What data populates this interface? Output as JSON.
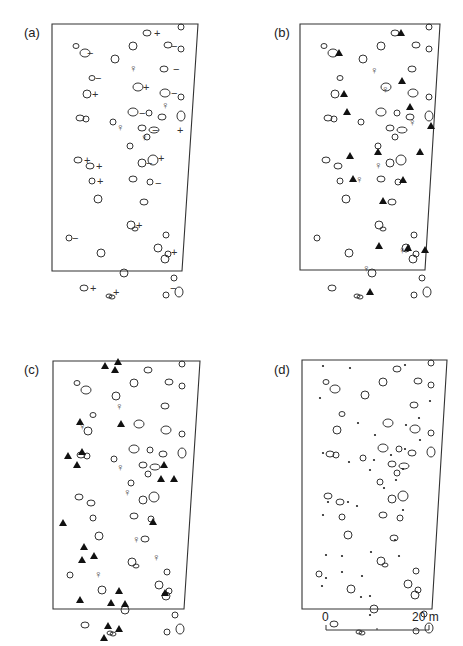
{
  "figure": {
    "panels": [
      {
        "id": "a",
        "label": "(a)",
        "symbols_present": [
          "stone",
          "plus",
          "minus",
          "female"
        ]
      },
      {
        "id": "b",
        "label": "(b)",
        "symbols_present": [
          "stone",
          "triangle",
          "female"
        ]
      },
      {
        "id": "c",
        "label": "(c)",
        "symbols_present": [
          "stone",
          "triangle",
          "female"
        ]
      },
      {
        "id": "d",
        "label": "(d)",
        "symbols_present": [
          "stone",
          "dot"
        ]
      }
    ],
    "scale_bar": {
      "start_label": "0",
      "end_label": "20 m"
    }
  },
  "symbols": {
    "plus": "+",
    "minus": "−",
    "female": "♀"
  },
  "stones": [
    [
      95,
      9,
      4,
      3
    ],
    [
      129,
      3,
      3,
      3
    ],
    [
      24,
      22,
      3,
      2.5
    ],
    [
      33,
      29,
      5,
      4
    ],
    [
      81,
      22,
      4,
      4
    ],
    [
      116,
      21,
      4,
      3
    ],
    [
      129,
      25,
      3,
      3
    ],
    [
      63,
      35,
      4,
      4
    ],
    [
      112,
      45,
      4,
      3
    ],
    [
      40,
      54,
      3,
      2.5
    ],
    [
      35,
      70,
      4,
      4
    ],
    [
      86,
      63,
      5,
      4
    ],
    [
      113,
      69,
      5,
      4
    ],
    [
      129,
      73,
      3,
      3
    ],
    [
      97,
      89,
      3,
      3
    ],
    [
      110,
      93,
      4,
      3
    ],
    [
      28,
      94,
      4,
      3
    ],
    [
      34,
      95,
      3,
      3
    ],
    [
      81,
      88,
      5,
      4
    ],
    [
      129,
      92,
      4,
      5
    ],
    [
      61,
      98,
      3,
      3
    ],
    [
      90,
      104,
      4,
      3
    ],
    [
      102,
      106,
      5,
      3
    ],
    [
      95,
      113,
      3,
      3
    ],
    [
      78,
      122,
      3,
      3
    ],
    [
      26,
      136,
      4,
      3
    ],
    [
      38,
      142,
      4,
      3
    ],
    [
      90,
      139,
      4,
      4
    ],
    [
      101,
      136,
      5,
      5
    ],
    [
      40,
      157,
      3,
      3
    ],
    [
      81,
      155,
      4,
      3
    ],
    [
      98,
      158,
      3,
      3
    ],
    [
      46,
      175,
      4,
      4
    ],
    [
      92,
      178,
      4,
      3
    ],
    [
      17,
      214,
      3,
      3
    ],
    [
      79,
      201,
      4,
      4
    ],
    [
      83,
      205,
      3,
      2
    ],
    [
      114,
      211,
      3,
      3
    ],
    [
      49,
      229,
      4,
      4
    ],
    [
      106,
      224,
      4,
      4
    ],
    [
      116,
      230,
      3,
      3
    ],
    [
      72,
      249,
      4,
      4
    ],
    [
      113,
      235,
      4,
      4
    ],
    [
      122,
      254,
      3,
      3
    ],
    [
      32,
      264,
      4,
      3
    ],
    [
      57,
      272,
      3,
      2
    ],
    [
      60,
      273,
      3,
      2
    ],
    [
      114,
      271,
      3,
      3
    ],
    [
      127,
      268,
      4,
      5
    ]
  ],
  "panel_a_marks": [
    [
      "plus",
      [
        105,
        9
      ]
    ],
    [
      "minus",
      [
        38,
        29
      ]
    ],
    [
      "minus",
      [
        122,
        22
      ]
    ],
    [
      "female",
      [
        80,
        44
      ]
    ],
    [
      "minus",
      [
        124,
        45
      ]
    ],
    [
      "minus",
      [
        46,
        54
      ]
    ],
    [
      "plus",
      [
        43,
        70
      ]
    ],
    [
      "plus",
      [
        94,
        63
      ]
    ],
    [
      "minus",
      [
        122,
        69
      ]
    ],
    [
      "female",
      [
        112,
        81
      ]
    ],
    [
      "minus",
      [
        90,
        89
      ]
    ],
    [
      "female",
      [
        67,
        103
      ]
    ],
    [
      "minus",
      [
        103,
        106
      ]
    ],
    [
      "plus",
      [
        128,
        106
      ]
    ],
    [
      "plus",
      [
        35,
        136
      ]
    ],
    [
      "plus",
      [
        47,
        142
      ]
    ],
    [
      "minus",
      [
        97,
        139
      ]
    ],
    [
      "plus",
      [
        109,
        134
      ]
    ],
    [
      "female",
      [
        91,
        113
      ]
    ],
    [
      "plus",
      [
        48,
        157
      ]
    ],
    [
      "minus",
      [
        106,
        159
      ]
    ],
    [
      "minus",
      [
        23,
        214
      ]
    ],
    [
      "plus",
      [
        87,
        201
      ]
    ],
    [
      "plus",
      [
        122,
        228
      ]
    ],
    [
      "plus",
      [
        41,
        264
      ]
    ],
    [
      "plus",
      [
        64,
        268
      ]
    ],
    [
      "minus",
      [
        121,
        264
      ]
    ]
  ],
  "panel_b_marks": [
    [
      "tri",
      [
        101,
        9
      ]
    ],
    [
      "tri",
      [
        39,
        29
      ]
    ],
    [
      "female",
      [
        73,
        46
      ]
    ],
    [
      "tri",
      [
        102,
        57
      ]
    ],
    [
      "tri",
      [
        44,
        70
      ]
    ],
    [
      "female",
      [
        84,
        65
      ]
    ],
    [
      "tri",
      [
        47,
        88
      ]
    ],
    [
      "tri",
      [
        110,
        83
      ]
    ],
    [
      "female",
      [
        111,
        98
      ]
    ],
    [
      "tri",
      [
        131,
        102
      ]
    ],
    [
      "tri",
      [
        50,
        132
      ]
    ],
    [
      "tri",
      [
        78,
        128
      ]
    ],
    [
      "tri",
      [
        120,
        128
      ]
    ],
    [
      "female",
      [
        77,
        141
      ]
    ],
    [
      "female",
      [
        58,
        155
      ]
    ],
    [
      "tri",
      [
        53,
        155
      ]
    ],
    [
      "tri",
      [
        103,
        156
      ]
    ],
    [
      "tri",
      [
        83,
        177
      ]
    ],
    [
      "tri",
      [
        79,
        222
      ]
    ],
    [
      "tri",
      [
        108,
        224
      ]
    ],
    [
      "female",
      [
        101,
        226
      ]
    ],
    [
      "tri",
      [
        125,
        226
      ]
    ],
    [
      "female",
      [
        65,
        244
      ]
    ],
    [
      "tri",
      [
        70,
        268
      ]
    ]
  ],
  "panel_c_marks": [
    [
      "tri",
      [
        52,
        5
      ]
    ],
    [
      "tri",
      [
        65,
        1
      ]
    ],
    [
      "tri",
      [
        62,
        9
      ]
    ],
    [
      "female",
      [
        65,
        45
      ]
    ],
    [
      "tri",
      [
        27,
        61
      ]
    ],
    [
      "tri",
      [
        68,
        63
      ]
    ],
    [
      "female",
      [
        28,
        65
      ]
    ],
    [
      "tri",
      [
        15,
        95
      ]
    ],
    [
      "tri",
      [
        29,
        91
      ]
    ],
    [
      "tri",
      [
        24,
        104
      ]
    ],
    [
      "female",
      [
        66,
        106
      ]
    ],
    [
      "tri",
      [
        111,
        104
      ]
    ],
    [
      "tri",
      [
        108,
        118
      ]
    ],
    [
      "tri",
      [
        121,
        118
      ]
    ],
    [
      "tri",
      [
        10,
        162
      ]
    ],
    [
      "tri",
      [
        100,
        161
      ]
    ],
    [
      "female",
      [
        73,
        131
      ]
    ],
    [
      "female",
      [
        82,
        178
      ]
    ],
    [
      "tri",
      [
        31,
        186
      ]
    ],
    [
      "tri",
      [
        29,
        199
      ]
    ],
    [
      "tri",
      [
        41,
        195
      ]
    ],
    [
      "female",
      [
        44,
        213
      ]
    ],
    [
      "female",
      [
        102,
        196
      ]
    ],
    [
      "tri",
      [
        27,
        239
      ]
    ],
    [
      "tri",
      [
        66,
        230
      ]
    ],
    [
      "tri",
      [
        58,
        242
      ]
    ],
    [
      "tri",
      [
        72,
        243
      ]
    ],
    [
      "tri",
      [
        112,
        232
      ]
    ],
    [
      "tri",
      [
        55,
        265
      ]
    ],
    [
      "tri",
      [
        66,
        268
      ]
    ],
    [
      "tri",
      [
        51,
        277
      ]
    ]
  ],
  "panel_d_dots": [
    [
      21,
      6
    ],
    [
      48,
      8
    ],
    [
      103,
      5
    ],
    [
      117,
      58
    ],
    [
      56,
      63
    ],
    [
      101,
      109
    ],
    [
      72,
      100
    ],
    [
      94,
      120
    ],
    [
      82,
      128
    ],
    [
      47,
      102
    ],
    [
      89,
      95
    ],
    [
      101,
      150
    ],
    [
      93,
      180
    ],
    [
      46,
      142
    ],
    [
      26,
      142
    ],
    [
      68,
      110
    ],
    [
      20,
      226
    ],
    [
      59,
      237
    ],
    [
      60,
      216
    ],
    [
      97,
      196
    ],
    [
      21,
      155
    ],
    [
      68,
      236
    ],
    [
      40,
      196
    ],
    [
      40,
      212
    ],
    [
      104,
      65
    ],
    [
      24,
      195
    ],
    [
      24,
      218
    ],
    [
      69,
      192
    ],
    [
      68,
      255
    ],
    [
      73,
      75
    ],
    [
      21,
      93
    ],
    [
      55,
      146
    ],
    [
      103,
      89
    ],
    [
      118,
      80
    ],
    [
      128,
      41
    ],
    [
      18,
      38
    ]
  ],
  "colors": {
    "ink": "#333333",
    "fill_mark": "#111111",
    "background": "#ffffff"
  }
}
